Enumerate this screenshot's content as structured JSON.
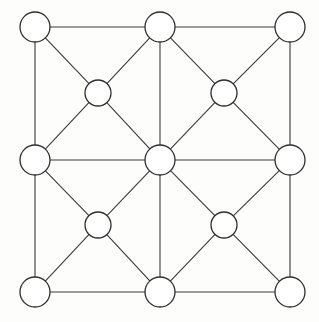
{
  "figure": {
    "type": "node-link-diagram",
    "width": 319,
    "height": 322,
    "background_color": "#fdfdfc",
    "edge_color": "#3a3a3a",
    "node_fill_color": "#ffffff",
    "node_stroke_color": "#2e2e2e",
    "edge_stroke_width": 1.1,
    "node_stroke_width": 1.3,
    "node_count": 13,
    "edge_count": 28
  },
  "nodes": [
    {
      "id": "n-tl",
      "label": "",
      "x": 35,
      "y": 27,
      "r": 15,
      "role": "corner-top-left"
    },
    {
      "id": "n-tm",
      "label": "",
      "x": 160,
      "y": 27,
      "r": 15,
      "role": "edge-top-middle"
    },
    {
      "id": "n-tr",
      "label": "",
      "x": 290,
      "y": 27,
      "r": 15,
      "role": "corner-top-right"
    },
    {
      "id": "n-ml",
      "label": "",
      "x": 35,
      "y": 160,
      "r": 15,
      "role": "edge-middle-left"
    },
    {
      "id": "n-cc",
      "label": "",
      "x": 160,
      "y": 160,
      "r": 15,
      "role": "center"
    },
    {
      "id": "n-mr",
      "label": "",
      "x": 290,
      "y": 160,
      "r": 15,
      "role": "edge-middle-right"
    },
    {
      "id": "n-bl",
      "label": "",
      "x": 35,
      "y": 292,
      "r": 15,
      "role": "corner-bottom-left"
    },
    {
      "id": "n-bm",
      "label": "",
      "x": 160,
      "y": 292,
      "r": 15,
      "role": "edge-bottom-middle"
    },
    {
      "id": "n-br",
      "label": "",
      "x": 290,
      "y": 292,
      "r": 15,
      "role": "corner-bottom-right"
    },
    {
      "id": "n-q-ul",
      "label": "",
      "x": 98,
      "y": 93,
      "r": 13,
      "role": "quadrant-center-upper-left"
    },
    {
      "id": "n-q-ur",
      "label": "",
      "x": 224,
      "y": 93,
      "r": 13,
      "role": "quadrant-center-upper-right"
    },
    {
      "id": "n-q-ll",
      "label": "",
      "x": 98,
      "y": 225,
      "r": 13,
      "role": "quadrant-center-lower-left"
    },
    {
      "id": "n-q-lr",
      "label": "",
      "x": 224,
      "y": 225,
      "r": 13,
      "role": "quadrant-center-lower-right"
    }
  ],
  "edges": [
    {
      "from": "n-tl",
      "to": "n-tm",
      "kind": "grid-horizontal"
    },
    {
      "from": "n-tm",
      "to": "n-tr",
      "kind": "grid-horizontal"
    },
    {
      "from": "n-ml",
      "to": "n-cc",
      "kind": "grid-horizontal"
    },
    {
      "from": "n-cc",
      "to": "n-mr",
      "kind": "grid-horizontal"
    },
    {
      "from": "n-bl",
      "to": "n-bm",
      "kind": "grid-horizontal"
    },
    {
      "from": "n-bm",
      "to": "n-br",
      "kind": "grid-horizontal"
    },
    {
      "from": "n-tl",
      "to": "n-ml",
      "kind": "grid-vertical"
    },
    {
      "from": "n-ml",
      "to": "n-bl",
      "kind": "grid-vertical"
    },
    {
      "from": "n-tm",
      "to": "n-cc",
      "kind": "grid-vertical"
    },
    {
      "from": "n-cc",
      "to": "n-bm",
      "kind": "grid-vertical"
    },
    {
      "from": "n-tr",
      "to": "n-mr",
      "kind": "grid-vertical"
    },
    {
      "from": "n-mr",
      "to": "n-br",
      "kind": "grid-vertical"
    },
    {
      "from": "n-tl",
      "to": "n-q-ul",
      "kind": "diagonal"
    },
    {
      "from": "n-q-ul",
      "to": "n-cc",
      "kind": "diagonal"
    },
    {
      "from": "n-tm",
      "to": "n-q-ul",
      "kind": "diagonal"
    },
    {
      "from": "n-q-ul",
      "to": "n-ml",
      "kind": "diagonal"
    },
    {
      "from": "n-tm",
      "to": "n-q-ur",
      "kind": "diagonal"
    },
    {
      "from": "n-q-ur",
      "to": "n-mr",
      "kind": "diagonal"
    },
    {
      "from": "n-tr",
      "to": "n-q-ur",
      "kind": "diagonal"
    },
    {
      "from": "n-q-ur",
      "to": "n-cc",
      "kind": "diagonal"
    },
    {
      "from": "n-ml",
      "to": "n-q-ll",
      "kind": "diagonal"
    },
    {
      "from": "n-q-ll",
      "to": "n-bm",
      "kind": "diagonal"
    },
    {
      "from": "n-cc",
      "to": "n-q-ll",
      "kind": "diagonal"
    },
    {
      "from": "n-q-ll",
      "to": "n-bl",
      "kind": "diagonal"
    },
    {
      "from": "n-cc",
      "to": "n-q-lr",
      "kind": "diagonal"
    },
    {
      "from": "n-q-lr",
      "to": "n-br",
      "kind": "diagonal"
    },
    {
      "from": "n-mr",
      "to": "n-q-lr",
      "kind": "diagonal"
    },
    {
      "from": "n-q-lr",
      "to": "n-bm",
      "kind": "diagonal"
    }
  ]
}
